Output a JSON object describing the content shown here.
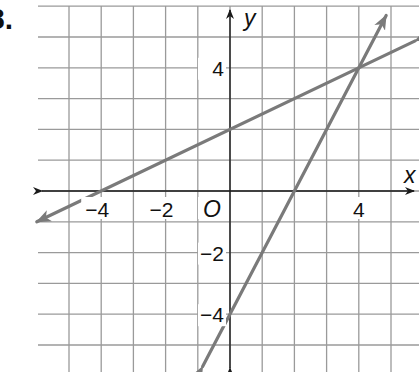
{
  "problem": {
    "number": "8."
  },
  "chart_data": {
    "type": "line",
    "title": "",
    "xlabel": "x",
    "ylabel": "y",
    "origin_label": "O",
    "xlim": [
      -6,
      5.9
    ],
    "ylim": [
      -5.9,
      6
    ],
    "grid": true,
    "x_ticks": [
      {
        "value": -4,
        "label": "−4"
      },
      {
        "value": -2,
        "label": "−2"
      },
      {
        "value": 4,
        "label": "4"
      }
    ],
    "y_ticks": [
      {
        "value": 4,
        "label": "4"
      },
      {
        "value": -2,
        "label": "−2"
      },
      {
        "value": -4,
        "label": "−4"
      }
    ],
    "series": [
      {
        "name": "line-shallow",
        "equation": "y = 0.5x + 2",
        "slope": 0.5,
        "intercept": 2,
        "points": [
          [
            -4,
            0
          ],
          [
            0,
            2
          ],
          [
            4,
            4
          ]
        ],
        "color": "#7a7a7a"
      },
      {
        "name": "line-steep",
        "equation": "y = 2x - 4",
        "slope": 2,
        "intercept": -4,
        "points": [
          [
            0,
            -4
          ],
          [
            2,
            0
          ],
          [
            4,
            4
          ]
        ],
        "color": "#7a7a7a"
      }
    ],
    "intersection": [
      4,
      4
    ]
  },
  "colors": {
    "grid": "#9a9a9a",
    "axis": "#1a1a1a",
    "line": "#7a7a7a"
  }
}
